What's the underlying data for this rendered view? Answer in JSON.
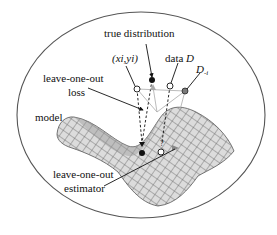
{
  "figure": {
    "labels": {
      "true_distribution": "true distribution",
      "sample_point": "(xi,yi)",
      "data": "data",
      "data_symbol": "D",
      "data_minus_i": "D",
      "data_minus_i_sub": "-i",
      "loo_loss_line1": "leave-one-out",
      "loo_loss_line2": "loss",
      "model": "model",
      "loo_estimator_line1": "leave-one-out",
      "loo_estimator_line2": "estimator",
      "unknown_mark": "?"
    },
    "colors": {
      "ink": "#111111",
      "surface_fill": "#d9d9d9",
      "surface_grid": "#6a6a6a",
      "outline": "#555555",
      "connector": "#aaaaaa",
      "grey_point": "#7a7a7a"
    }
  }
}
